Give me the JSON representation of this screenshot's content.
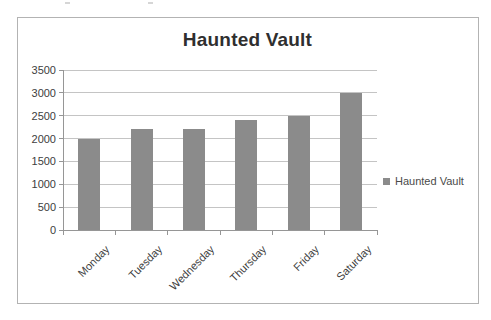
{
  "chart_data": {
    "type": "bar",
    "title": "Haunted Vault",
    "categories": [
      "Monday",
      "Tuesday",
      "Wednesday",
      "Thursday",
      "Friday",
      "Saturday"
    ],
    "series": [
      {
        "name": "Haunted Vault",
        "values": [
          2000,
          2200,
          2200,
          2400,
          2500,
          3000
        ]
      }
    ],
    "xlabel": "",
    "ylabel": "",
    "ylim": [
      0,
      3500
    ],
    "yticks": [
      0,
      500,
      1000,
      1500,
      2000,
      2500,
      3000,
      3500
    ],
    "grid": true,
    "legend_position": "right",
    "colors": {
      "bar": "#8b8b8b",
      "gridline": "#c4c4c4",
      "axis": "#969696",
      "text": "#404040",
      "title": "#2f2f2f",
      "legend_text": "#4a4a4a",
      "frame_border": "#b3b3b3",
      "background": "#ffffff"
    }
  },
  "legend": {
    "label": "Haunted Vault",
    "marker": "square"
  }
}
